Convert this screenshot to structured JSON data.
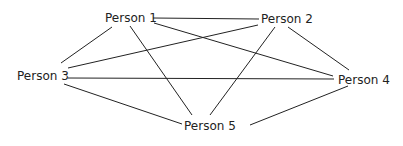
{
  "diagram": {
    "type": "network-graph",
    "line_color": "#222222",
    "text_color": "#222222",
    "nodes": [
      {
        "id": "p1",
        "label": "Person 1",
        "x": 105,
        "y": 11
      },
      {
        "id": "p2",
        "label": "Person 2",
        "x": 261,
        "y": 12
      },
      {
        "id": "p3",
        "label": "Person 3",
        "x": 17,
        "y": 69
      },
      {
        "id": "p4",
        "label": "Person 4",
        "x": 338,
        "y": 73
      },
      {
        "id": "p5",
        "label": "Person 5",
        "x": 184,
        "y": 119
      }
    ],
    "edges": [
      {
        "from": "p1",
        "to": "p2"
      },
      {
        "from": "p1",
        "to": "p3"
      },
      {
        "from": "p1",
        "to": "p4"
      },
      {
        "from": "p1",
        "to": "p5"
      },
      {
        "from": "p2",
        "to": "p3"
      },
      {
        "from": "p2",
        "to": "p4"
      },
      {
        "from": "p2",
        "to": "p5"
      },
      {
        "from": "p3",
        "to": "p4"
      },
      {
        "from": "p3",
        "to": "p5"
      },
      {
        "from": "p4",
        "to": "p5"
      }
    ]
  }
}
